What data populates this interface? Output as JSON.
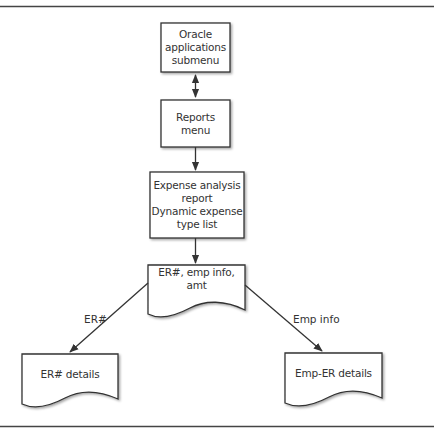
{
  "diagram": {
    "type": "flowchart",
    "colors": {
      "stroke": "#333333",
      "background": "#ffffff",
      "text": "#333333"
    },
    "nodes": [
      {
        "id": "oracle_submenu",
        "shape": "box",
        "lines": [
          "Oracle",
          "applications",
          "submenu"
        ]
      },
      {
        "id": "reports_menu",
        "shape": "box",
        "lines": [
          "Reports menu"
        ]
      },
      {
        "id": "expense_report",
        "shape": "box",
        "lines": [
          "Expense analysis",
          "report",
          "Dynamic expense",
          "type list"
        ]
      },
      {
        "id": "er_emp_amt",
        "shape": "document",
        "lines": [
          "ER#, emp info, amt"
        ]
      },
      {
        "id": "er_details",
        "shape": "document",
        "lines": [
          "ER# details"
        ]
      },
      {
        "id": "emp_er_details",
        "shape": "document",
        "lines": [
          "Emp-ER details"
        ]
      }
    ],
    "edges": [
      {
        "from": "oracle_submenu",
        "to": "reports_menu",
        "direction": "bidirectional",
        "label": ""
      },
      {
        "from": "reports_menu",
        "to": "expense_report",
        "direction": "forward",
        "label": ""
      },
      {
        "from": "expense_report",
        "to": "er_emp_amt",
        "direction": "forward",
        "label": ""
      },
      {
        "from": "er_emp_amt",
        "to": "er_details",
        "direction": "forward",
        "label": "ER#"
      },
      {
        "from": "er_emp_amt",
        "to": "emp_er_details",
        "direction": "forward",
        "label": "Emp info"
      }
    ]
  }
}
